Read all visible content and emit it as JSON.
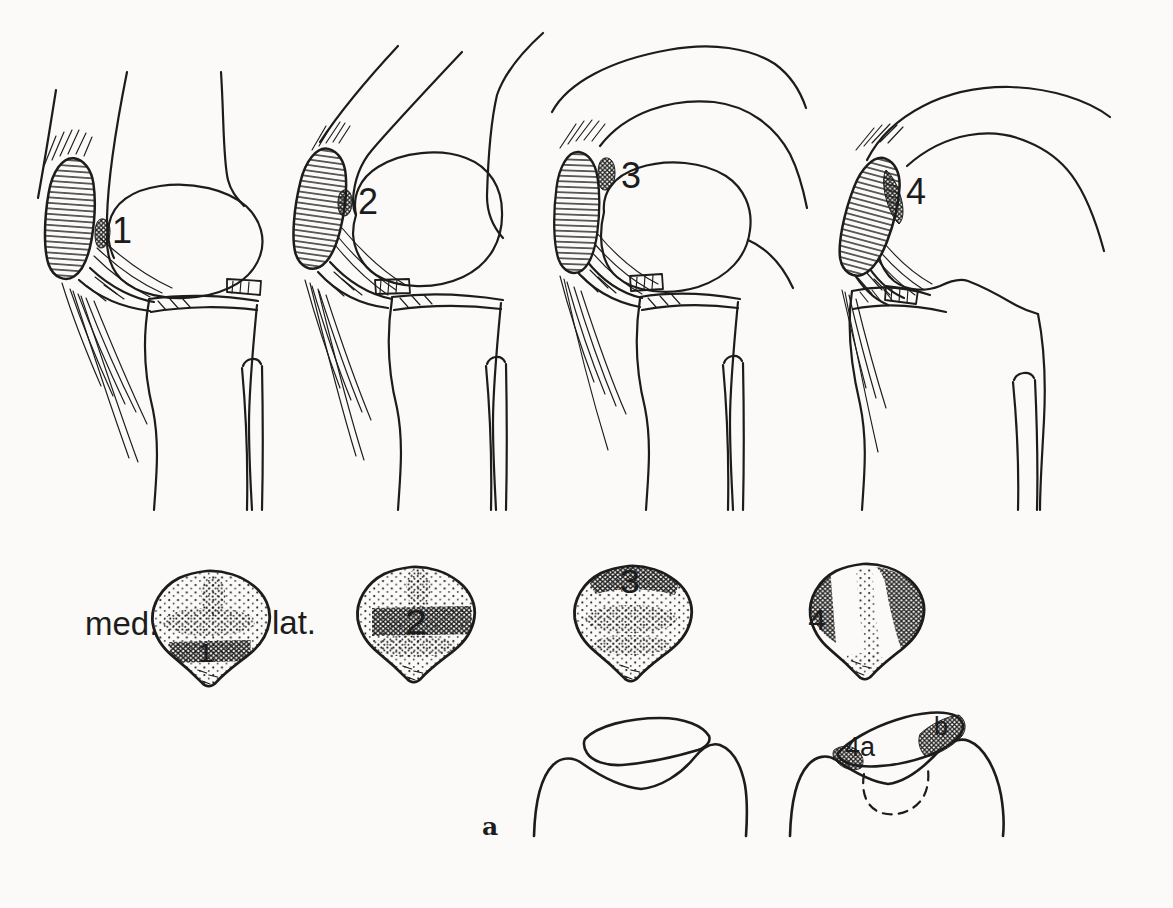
{
  "canvas": {
    "background": "#fbfaf8",
    "ink": "#1c1c1c"
  },
  "labels": {
    "stage1": "1",
    "stage2": "2",
    "stage3": "3",
    "stage4": "4",
    "rear1": "1",
    "rear2": "2",
    "rear3": "3",
    "rear4": "4",
    "medial": "med.",
    "lateral": "lat.",
    "panel": "a",
    "axial_medial": "4a",
    "axial_lateral": "b"
  }
}
